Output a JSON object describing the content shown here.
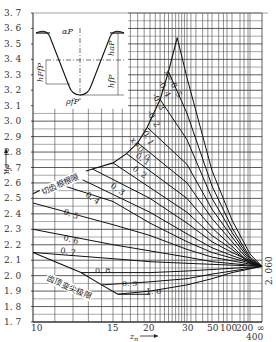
{
  "chart_data": {
    "type": "line",
    "title": "",
    "xlabel": "z_n",
    "ylabel": "Y_F",
    "ylim": [
      1.7,
      3.7
    ],
    "y_ticks": [
      "1.7",
      "1.8",
      "1.9",
      "2.0",
      "2.1",
      "2.2",
      "2.3",
      "2.4",
      "2.5",
      "2.6",
      "2.7",
      "2.8",
      "2.9",
      "3.0",
      "3.1",
      "3.2",
      "3.3",
      "3.4",
      "3.5",
      "3.6",
      "3.7"
    ],
    "x_ticks": [
      "10",
      "15",
      "20",
      "30",
      "50",
      "100",
      "200",
      "400",
      "∞"
    ],
    "x_scale": "reciprocal (1/z)",
    "convergence_value_label": "2.060",
    "convergence_value": 2.06,
    "boundary_labels": {
      "upper": "切齿根根限",
      "lower": "齿顶变尖极限"
    },
    "series": [
      {
        "name": "x = -0.5",
        "label": "x=-0.5",
        "points": [
          [
            26.5,
            3.54
          ],
          [
            30,
            3.28
          ],
          [
            50,
            2.68
          ],
          [
            100,
            2.36
          ],
          [
            400,
            2.14
          ],
          [
            "∞",
            2.06
          ]
        ]
      },
      {
        "name": "x = -0.4",
        "label": "-0.4",
        "points": [
          [
            24,
            3.32
          ],
          [
            30,
            3.05
          ],
          [
            50,
            2.58
          ],
          [
            100,
            2.31
          ],
          [
            400,
            2.12
          ],
          [
            "∞",
            2.06
          ]
        ]
      },
      {
        "name": "x = -0.3",
        "label": "-0.3",
        "points": [
          [
            22,
            3.14
          ],
          [
            30,
            2.88
          ],
          [
            50,
            2.5
          ],
          [
            100,
            2.28
          ],
          [
            400,
            2.11
          ],
          [
            "∞",
            2.06
          ]
        ]
      },
      {
        "name": "x = -0.2",
        "label": "-0.2",
        "points": [
          [
            19.5,
            2.96
          ],
          [
            30,
            2.72
          ],
          [
            50,
            2.43
          ],
          [
            100,
            2.25
          ],
          [
            400,
            2.1
          ],
          [
            "∞",
            2.06
          ]
        ]
      },
      {
        "name": "x = -0.1",
        "label": "-0.1",
        "points": [
          [
            18,
            2.86
          ],
          [
            30,
            2.6
          ],
          [
            50,
            2.37
          ],
          [
            100,
            2.22
          ],
          [
            400,
            2.09
          ],
          [
            "∞",
            2.06
          ]
        ]
      },
      {
        "name": "x = 0",
        "label": "x=0.0",
        "points": [
          [
            16.5,
            2.79
          ],
          [
            30,
            2.5
          ],
          [
            50,
            2.31
          ],
          [
            100,
            2.19
          ],
          [
            400,
            2.08
          ],
          [
            "∞",
            2.06
          ]
        ]
      },
      {
        "name": "x = 0.1",
        "label": "0.1",
        "points": [
          [
            15,
            2.73
          ],
          [
            30,
            2.41
          ],
          [
            50,
            2.26
          ],
          [
            100,
            2.17
          ],
          [
            400,
            2.08
          ],
          [
            "∞",
            2.06
          ]
        ]
      },
      {
        "name": "x = 0.2",
        "label": "0.2",
        "points": [
          [
            13.3,
            2.69
          ],
          [
            20,
            2.5
          ],
          [
            30,
            2.34
          ],
          [
            50,
            2.22
          ],
          [
            100,
            2.15
          ],
          [
            "∞",
            2.06
          ]
        ]
      },
      {
        "name": "x = 0.3",
        "label": "0.3",
        "points": [
          [
            12,
            2.65
          ],
          [
            20,
            2.41
          ],
          [
            30,
            2.27
          ],
          [
            50,
            2.18
          ],
          [
            100,
            2.13
          ],
          [
            "∞",
            2.06
          ]
        ]
      },
      {
        "name": "x = 0.4",
        "label": "0.4",
        "points": [
          [
            11,
            2.6
          ],
          [
            15,
            2.48
          ],
          [
            20,
            2.34
          ],
          [
            30,
            2.22
          ],
          [
            50,
            2.15
          ],
          [
            "∞",
            2.06
          ]
        ]
      },
      {
        "name": "x = 0.5",
        "label": "0.5",
        "points": [
          [
            10,
            2.47
          ],
          [
            15,
            2.33
          ],
          [
            20,
            2.26
          ],
          [
            30,
            2.17
          ],
          [
            50,
            2.12
          ],
          [
            "∞",
            2.06
          ]
        ]
      },
      {
        "name": "x = 0.6",
        "label": "0.6",
        "points": [
          [
            10,
            2.3
          ],
          [
            15,
            2.2
          ],
          [
            20,
            2.16
          ],
          [
            30,
            2.12
          ],
          [
            50,
            2.09
          ],
          [
            "∞",
            2.06
          ]
        ]
      },
      {
        "name": "x = 0.7",
        "label": "0.7",
        "points": [
          [
            10,
            2.15
          ],
          [
            15,
            2.11
          ],
          [
            20,
            2.09
          ],
          [
            30,
            2.08
          ],
          [
            "∞",
            2.06
          ]
        ]
      },
      {
        "name": "x = 0.8",
        "label": "0.8",
        "points": [
          [
            12.5,
            2.02
          ],
          [
            15,
            2.02
          ],
          [
            20,
            2.02
          ],
          [
            30,
            2.03
          ],
          [
            50,
            2.04
          ],
          [
            "∞",
            2.06
          ]
        ]
      },
      {
        "name": "x = 0.9",
        "label": "0.9",
        "points": [
          [
            14,
            1.94
          ],
          [
            20,
            1.96
          ],
          [
            30,
            1.98
          ],
          [
            50,
            2.01
          ],
          [
            "∞",
            2.06
          ]
        ]
      },
      {
        "name": "x = 1.0",
        "label": "1.0",
        "points": [
          [
            15.5,
            1.88
          ],
          [
            20,
            1.9
          ],
          [
            30,
            1.94
          ],
          [
            50,
            1.98
          ],
          [
            100,
            2.02
          ],
          [
            "∞",
            2.06
          ]
        ]
      }
    ],
    "grid": true,
    "legend_position": "inline labels on curves",
    "inset": {
      "description": "Basic rack tooth profile",
      "labels": [
        "α_P",
        "h_aP",
        "h_fP",
        "h_FfP",
        "ρ_fP"
      ]
    }
  }
}
